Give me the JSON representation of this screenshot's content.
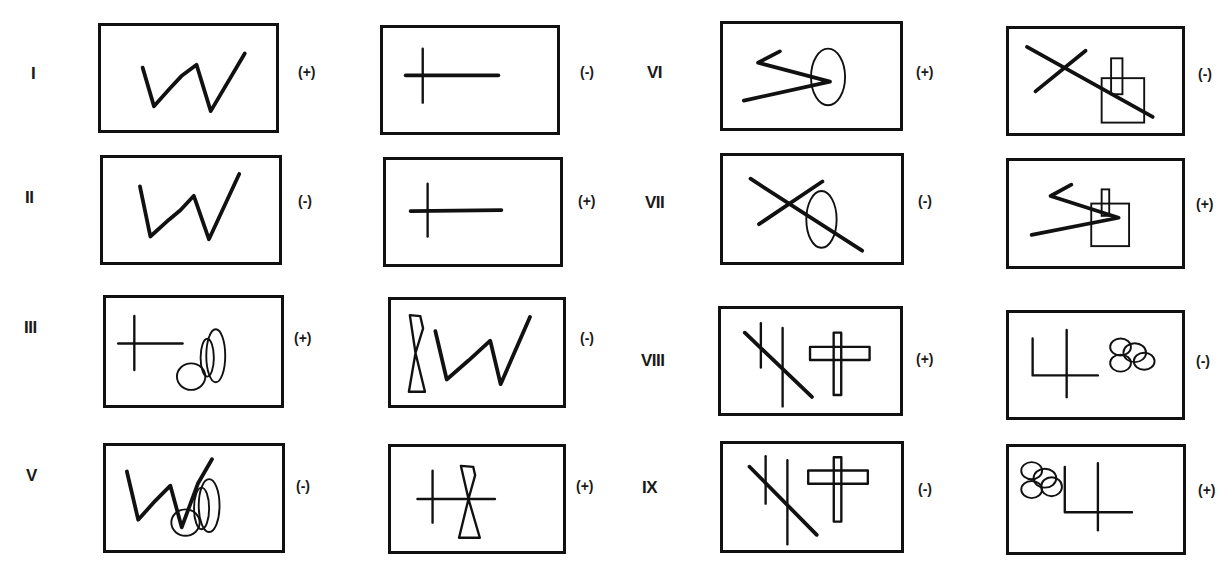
{
  "figure": {
    "rows": [
      {
        "id": "I",
        "label": "I",
        "left": {
          "content": "zigzag-w",
          "sign": "(+)"
        },
        "right": {
          "content": "cross-line",
          "sign": "(-)"
        }
      },
      {
        "id": "II",
        "label": "II",
        "left": {
          "content": "zigzag-w",
          "sign": "(-)"
        },
        "right": {
          "content": "cross-line",
          "sign": "(+)"
        }
      },
      {
        "id": "III",
        "label": "III",
        "left": {
          "content": "cross-line-with-ellipses",
          "sign": "(+)"
        },
        "right": {
          "content": "hourglass-with-zigzag",
          "sign": "(-)"
        }
      },
      {
        "id": "V",
        "label": "V",
        "left": {
          "content": "zigzag-with-ellipses",
          "sign": "(-)"
        },
        "right": {
          "content": "cross-line-with-hourglass",
          "sign": "(+)"
        }
      },
      {
        "id": "VI",
        "label": "VI",
        "left": {
          "content": "arrow-lines-with-ellipse",
          "sign": "(+)"
        },
        "right": {
          "content": "x-lines-with-rectangles",
          "sign": "(-)"
        }
      },
      {
        "id": "VII",
        "label": "VII",
        "left": {
          "content": "x-lines-with-ellipse",
          "sign": "(-)"
        },
        "right": {
          "content": "arrow-lines-with-rectangles",
          "sign": "(+)"
        }
      },
      {
        "id": "VIII",
        "label": "VIII",
        "left": {
          "content": "slash-verticals-with-rect-cross",
          "sign": "(+)"
        },
        "right": {
          "content": "corner-cross-with-ellipse-cluster",
          "sign": "(-)"
        }
      },
      {
        "id": "IX",
        "label": "IX",
        "left": {
          "content": "slash-verticals-with-rect-cross",
          "sign": "(-)"
        },
        "right": {
          "content": "ellipse-cluster-with-corner-cross",
          "sign": "(+)"
        }
      }
    ]
  }
}
